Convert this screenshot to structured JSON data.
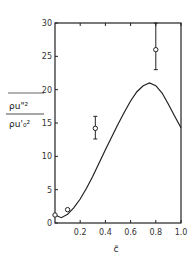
{
  "chart_data": {
    "type": "line",
    "title": "",
    "xlabel": "c̃",
    "ylabel": "ρu''² / ρu'₀²",
    "ylabel_numerator": "ρu\"²",
    "ylabel_denominator": "ρu'₀²",
    "xlim": [
      0,
      1.0
    ],
    "ylim": [
      0,
      30
    ],
    "grid": false,
    "legend": null,
    "x_ticks": [
      "0.2",
      "0.4",
      "0.6",
      "0.8",
      "1.0"
    ],
    "y_ticks": [
      "0",
      "5",
      "10",
      "15",
      "20",
      "25",
      "30"
    ],
    "series": [
      {
        "name": "model curve",
        "kind": "line",
        "x": [
          0,
          0.05,
          0.1,
          0.15,
          0.2,
          0.25,
          0.3,
          0.35,
          0.4,
          0.45,
          0.5,
          0.55,
          0.6,
          0.65,
          0.7,
          0.75,
          0.8,
          0.85,
          0.9,
          0.95,
          1.0
        ],
        "values": [
          1.2,
          0.8,
          1.3,
          2.3,
          3.6,
          5.2,
          7.0,
          9.0,
          11.0,
          12.9,
          14.8,
          16.6,
          18.3,
          19.7,
          20.6,
          21.0,
          20.6,
          19.5,
          17.8,
          16.0,
          14.3
        ]
      },
      {
        "name": "measurements",
        "kind": "scatter",
        "marker": "open-circle",
        "x": [
          0.0,
          0.1,
          0.32,
          0.8
        ],
        "values": [
          1.2,
          2.0,
          14.2,
          26.0
        ],
        "error_low": [
          null,
          null,
          12.6,
          23.0
        ],
        "error_high": [
          null,
          null,
          16.0,
          30.0
        ]
      }
    ]
  }
}
